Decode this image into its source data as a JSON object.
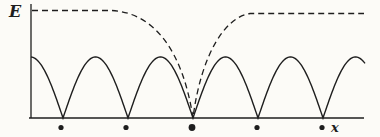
{
  "figure": {
    "width": 380,
    "height": 137,
    "background": "#fcfbf7",
    "ink": "#1e1e1e"
  },
  "chart_data": {
    "type": "line",
    "title": "",
    "xlabel": "x",
    "ylabel": "E",
    "x_tick_labels": [],
    "y_tick_labels": [],
    "grid": false,
    "legend": false,
    "x_unit": "lattice period a",
    "y_range_relative": [
      0,
      1
    ],
    "series": [
      {
        "name": "band-energy-solid",
        "line_style": "solid",
        "formula": "E(x) proportional to |sin(pi*x/a)|",
        "amplitude_relative": 0.57,
        "cusps_at_sites_x_units": [
          1,
          2,
          3,
          4,
          5
        ],
        "peaks_x_units": [
          0.5,
          1.5,
          2.5,
          3.5,
          4.5,
          5.5
        ],
        "description": "periodic arches whose cusps touch E=0 at every lattice site"
      },
      {
        "name": "envelope-dashed",
        "line_style": "dashed",
        "plateau_relative": 1.0,
        "dips_to_zero_at_site_x_units": 3,
        "description": "flat upper envelope that dips smoothly to the axis at the central lattice site and returns to the plateau"
      }
    ],
    "lattice_sites": {
      "marker": "filled-circle",
      "x_units": [
        1,
        2,
        3,
        4,
        5
      ],
      "emphasized_index": 2
    }
  },
  "geometry_px": {
    "axis": {
      "x0": 31,
      "y_top": 4,
      "baseline_y": 118,
      "x_left": 29,
      "x_right": 364,
      "stroke_width": 1.3
    },
    "solid": {
      "x_start": 31,
      "x_end": 365,
      "period": 65,
      "amplitude": 61,
      "cusps_x": [
        63,
        128,
        193,
        258,
        323
      ],
      "stroke_width": 1.4
    },
    "dashed": {
      "x_start": 32,
      "left_level": 10.5,
      "left_flat_end": 112,
      "c1": [
        155,
        13
      ],
      "c2": [
        183,
        52
      ],
      "center_x": 193,
      "c3": [
        201,
        55
      ],
      "c4": [
        225,
        17
      ],
      "right_flat_start": 250,
      "right_level": 13.5,
      "x_end": 364,
      "dash_array": "6 4",
      "stroke_width": 1.3
    },
    "dots": {
      "y": 127.5,
      "xs": [
        61,
        126,
        192,
        257,
        322
      ],
      "r": 2.6,
      "big_index": 2,
      "big_r": 3.4
    }
  }
}
